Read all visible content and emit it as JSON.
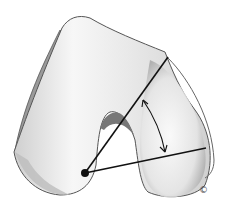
{
  "figure": {
    "copyright_symbol": "©",
    "colors": {
      "bone_fill": "#f2f2f2",
      "bone_shadow": "#b8b8b8",
      "outline": "#555555",
      "lines": "#111111"
    }
  }
}
